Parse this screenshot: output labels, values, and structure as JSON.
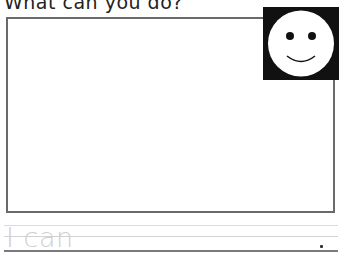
{
  "worksheet": {
    "title": "What can you do?",
    "picture_box": {
      "label": "drawing area"
    },
    "icon": "smiley-face-icon",
    "writing_line": {
      "traced_text": "I can",
      "end_punctuation": "."
    }
  },
  "colors": {
    "box_border": "#6a6a6a",
    "smiley_bg": "#111111",
    "trace_text": "#cfcfcf",
    "guide_line": "#dcdcdc",
    "base_line": "#7a7a7a"
  }
}
